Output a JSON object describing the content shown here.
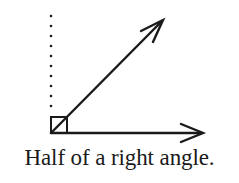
{
  "figure": {
    "caption": "Half of a right angle.",
    "stroke_color": "#1a1a1a",
    "vertex": [
      51,
      133
    ],
    "rays": [
      {
        "name": "horizontal-ray",
        "to": [
          203,
          133
        ]
      },
      {
        "name": "diagonal-ray",
        "to": [
          163,
          20
        ]
      }
    ],
    "dotted_reference_line": {
      "x": 51,
      "y_start": 16,
      "y_end": 108,
      "dot_count": 10
    },
    "right_angle_marker": {
      "x": 51,
      "y": 116,
      "size": 17
    }
  }
}
